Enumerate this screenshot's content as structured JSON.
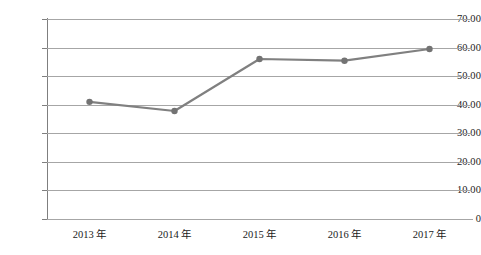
{
  "chart_data": {
    "type": "line",
    "title": "",
    "subtitle": "",
    "xlabel": "",
    "ylabel": "",
    "categories": [
      "2013 年",
      "2014 年",
      "2015 年",
      "2016 年",
      "2017 年"
    ],
    "series": [
      {
        "name": "series-1",
        "values": [
          41.0,
          37.8,
          56.0,
          55.4,
          59.5
        ]
      }
    ],
    "ylim": [
      0,
      70
    ],
    "ytick_labels": [
      "70.00",
      "60.00",
      "50.00",
      "40.00",
      "30.00",
      "20.00",
      "10.00",
      "0"
    ],
    "ytick_values": [
      70,
      60,
      50,
      40,
      30,
      20,
      10,
      0
    ],
    "grid": true,
    "grid_axis": "y",
    "legend": false,
    "legend_position": "none",
    "colors": {
      "line": "#808080",
      "marker": "#737373",
      "gridline": "#a6a6a6",
      "axis": "#7f7f7f",
      "text": "#1a1a1a",
      "background": "#ffffff"
    },
    "marker": {
      "shape": "circle",
      "radius": 3.2
    },
    "line_width": 2.2
  }
}
